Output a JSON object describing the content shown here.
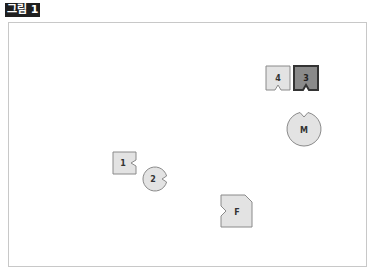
{
  "figure": {
    "label": "그림 1"
  },
  "colors": {
    "shape_fill": "#e3e3e3",
    "shape_stroke": "#8a8a8a",
    "highlight_fill": "#8a8a8a",
    "highlight_stroke": "#333333",
    "text": "#333333",
    "frame_border": "#c8c8c8"
  },
  "shapes": [
    {
      "id": "4",
      "label": "4",
      "type": "square-notch-bottom",
      "highlighted": false
    },
    {
      "id": "3",
      "label": "3",
      "type": "square-notch-bottom",
      "highlighted": true
    },
    {
      "id": "M",
      "label": "M",
      "type": "circle-notch-top",
      "highlighted": false
    },
    {
      "id": "1",
      "label": "1",
      "type": "square-notch-right",
      "highlighted": false
    },
    {
      "id": "2",
      "label": "2",
      "type": "circle-notch-right",
      "highlighted": false
    },
    {
      "id": "F",
      "label": "F",
      "type": "square-notch-left-cut-corner",
      "highlighted": false
    }
  ]
}
